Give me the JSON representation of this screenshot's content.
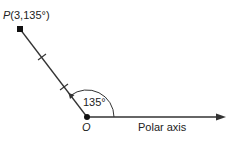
{
  "diagram": {
    "point_label_name": "P",
    "point_label_coords": "(3,135°)",
    "origin_label": "O",
    "angle_label": "135°",
    "axis_label": "Polar axis",
    "point": {
      "r": 3,
      "theta_deg": 135
    },
    "colors": {
      "stroke": "#333333",
      "text": "#222222"
    }
  }
}
